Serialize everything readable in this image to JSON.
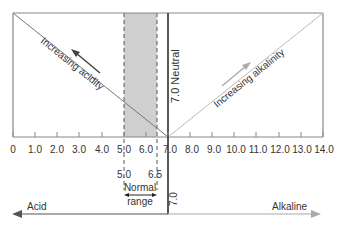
{
  "diagram": {
    "axis": {
      "min": 0,
      "max": 14,
      "ticks": [
        "0",
        "1.0",
        "2.0",
        "3.0",
        "4.0",
        "5.0",
        "6.0",
        "7.0",
        "8.0",
        "9.0",
        "10.0",
        "11.0",
        "12.0",
        "13.0",
        "14.0"
      ]
    },
    "neutral": {
      "value": 7.0,
      "label": "7.0 Neutral",
      "bottom_label": "7.0"
    },
    "normal_range": {
      "low": 5.0,
      "high": 6.5,
      "low_label": "5.0",
      "high_label": "6.5",
      "label_line1": "Normal",
      "label_line2": "range"
    },
    "acidity_label": "Increasing acidity",
    "alkalinity_label": "Increasing alkalinity",
    "acid_label": "Acid",
    "alkaline_label": "Alkaline",
    "colors": {
      "band": "#cfcfcf",
      "line": "#555555",
      "light_line": "#aaaaaa"
    }
  }
}
